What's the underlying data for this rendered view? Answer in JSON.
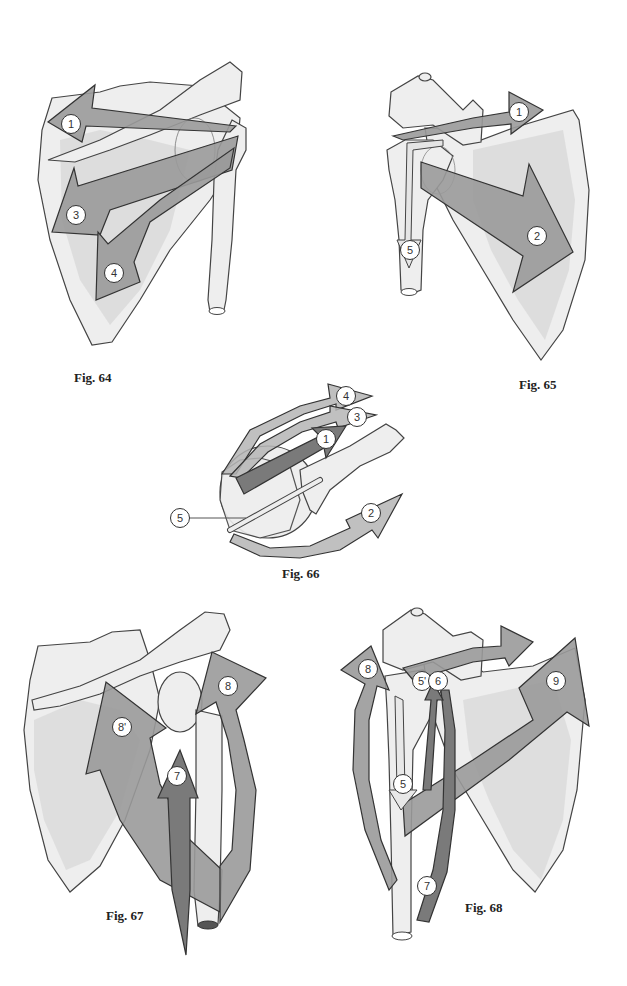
{
  "figures": [
    {
      "id": "fig64",
      "caption": "Fig. 64",
      "view": "posterior view of shoulder",
      "markers": [
        "1",
        "3",
        "4"
      ]
    },
    {
      "id": "fig65",
      "caption": "Fig. 65",
      "view": "anterior view of shoulder",
      "markers": [
        "1",
        "2",
        "5"
      ]
    },
    {
      "id": "fig66",
      "caption": "Fig. 66",
      "view": "superior view of shoulder",
      "markers": [
        "4",
        "3",
        "1",
        "2",
        "5"
      ]
    },
    {
      "id": "fig67",
      "caption": "Fig. 67",
      "view": "posterior view of shoulder",
      "markers": [
        "8",
        "8'",
        "7"
      ]
    },
    {
      "id": "fig68",
      "caption": "Fig. 68",
      "view": "anterior view of shoulder",
      "markers": [
        "8",
        "5'",
        "6",
        "9",
        "5",
        "7"
      ]
    }
  ],
  "colors": {
    "bone": "#eeeeee",
    "bone_shade": "#d2d2d2",
    "arrow": "#9a9a9a",
    "arrow_dark": "#7a7a7a",
    "outline": "#333333"
  }
}
